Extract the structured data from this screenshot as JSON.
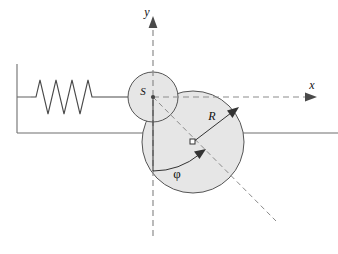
{
  "figure": {
    "labels": {
      "y_axis": "y",
      "x_axis": "x",
      "centre_of_mass": "S",
      "radius": "R",
      "angle": "φ"
    },
    "icons": {
      "y_axis_arrow": "arrow-up-icon",
      "x_axis_arrow": "arrow-right-icon",
      "radius_arrow": "arrow-radius-icon",
      "angle_arrow": "arrow-arc-icon"
    },
    "colors": {
      "disc_fill": "#e6e6e6",
      "disc_stroke": "#555555",
      "axis_dash": "#8c8c8c",
      "ground": "#6e6e6e",
      "spring": "#4a4a4a",
      "text": "#111111"
    },
    "geometry": {
      "origin": {
        "x": 153,
        "y": 97
      },
      "small_disc": {
        "cx": 153,
        "cy": 97,
        "r": 25
      },
      "large_disc": {
        "cx": 193,
        "cy": 142,
        "r": 51
      },
      "ground_y": 133,
      "wall_x": 17,
      "spring_y": 97,
      "spring_coils": 5,
      "angle_phi_degrees": 48
    },
    "elements": [
      "wall",
      "ground-line",
      "spring",
      "small-disc",
      "large-disc",
      "x-axis",
      "y-axis",
      "radius-arrow",
      "angle-arc",
      "inclined-dashed-line"
    ]
  }
}
